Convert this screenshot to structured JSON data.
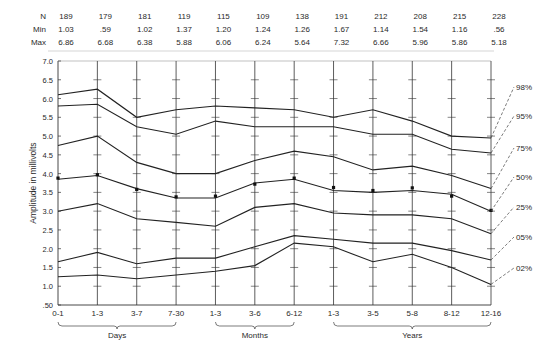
{
  "chart_data": {
    "type": "line",
    "title": "",
    "xlabel": "",
    "ylabel": "Amplitude in millivolts",
    "ylim": [
      0.5,
      7.0
    ],
    "yticks": [
      "7.0",
      "6.5",
      "6.0",
      "5.5",
      "5.0",
      "4.5",
      "4.0",
      "3.5",
      "3.0",
      "2.5",
      "2.0",
      "1.5",
      "1.0",
      ".50"
    ],
    "grid": false,
    "categories": [
      "0-1",
      "1-3",
      "3-7",
      "7-30",
      "1-3",
      "3-6",
      "6-12",
      "1-3",
      "3-5",
      "5-8",
      "8-12",
      "12-16"
    ],
    "category_groups": [
      {
        "label": "Days",
        "from": 0,
        "to": 3
      },
      {
        "label": "Months",
        "from": 4,
        "to": 6
      },
      {
        "label": "Years",
        "from": 7,
        "to": 11
      }
    ],
    "stats_table": {
      "row_labels": [
        "N",
        "Min",
        "Max"
      ],
      "N": [
        "189",
        "179",
        "181",
        "119",
        "115",
        "109",
        "138",
        "191",
        "212",
        "208",
        "215",
        "228"
      ],
      "Min": [
        "1.03",
        ".59",
        "1.02",
        "1.37",
        "1.20",
        "1.24",
        "1.26",
        "1.67",
        "1.14",
        "1.54",
        "1.16",
        ".56"
      ],
      "Max": [
        "6.86",
        "6.68",
        "6.38",
        "5.88",
        "6.06",
        "6.24",
        "5.64",
        "7.32",
        "6.66",
        "5.96",
        "5.86",
        "5.18"
      ]
    },
    "series": [
      {
        "name": "98%",
        "values": [
          6.1,
          6.25,
          5.5,
          5.7,
          5.8,
          5.75,
          5.7,
          5.5,
          5.7,
          5.4,
          5.0,
          4.95
        ]
      },
      {
        "name": "95%",
        "values": [
          5.8,
          5.85,
          5.25,
          5.05,
          5.4,
          5.25,
          5.25,
          5.25,
          5.05,
          5.05,
          4.65,
          4.55
        ]
      },
      {
        "name": "75%",
        "values": [
          4.75,
          5.0,
          4.3,
          4.0,
          4.0,
          4.35,
          4.6,
          4.45,
          4.1,
          4.2,
          3.95,
          3.6
        ]
      },
      {
        "name": "50%",
        "values": [
          3.85,
          3.95,
          3.6,
          3.35,
          3.35,
          3.75,
          3.85,
          3.55,
          3.5,
          3.55,
          3.45,
          3.0
        ],
        "markers": true
      },
      {
        "name": "25%",
        "values": [
          3.0,
          3.2,
          2.8,
          2.7,
          2.6,
          3.1,
          3.2,
          2.95,
          2.9,
          2.9,
          2.8,
          2.4
        ]
      },
      {
        "name": "05%",
        "values": [
          1.65,
          1.9,
          1.6,
          1.75,
          1.75,
          2.05,
          2.35,
          2.25,
          2.15,
          2.15,
          1.95,
          1.7
        ]
      },
      {
        "name": "02%",
        "values": [
          1.25,
          1.3,
          1.2,
          1.3,
          1.4,
          1.55,
          2.15,
          2.05,
          1.65,
          1.85,
          1.5,
          1.05
        ]
      }
    ],
    "mean_markers": [
      3.88,
      3.97,
      3.58,
      3.38,
      3.4,
      3.72,
      3.88,
      3.63,
      3.55,
      3.62,
      3.4,
      3.02
    ],
    "legend": {
      "position": "right",
      "style": "dashed leader lines"
    },
    "colors": {
      "line": "#222222",
      "axis": "#333333",
      "text": "#2a2a2a"
    }
  }
}
